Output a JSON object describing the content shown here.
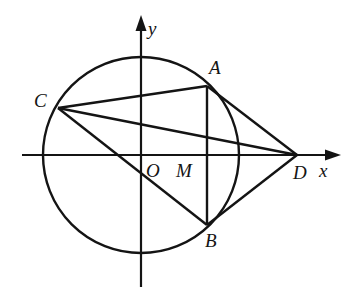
{
  "figure": {
    "kind": "geometry-diagram",
    "stroke_color": "#141414",
    "background_color": "#ffffff",
    "width": 351,
    "height": 295
  },
  "axes": {
    "x_axis": {
      "label": "x",
      "y": 155,
      "x_start": 22,
      "x_end": 335,
      "arrow": "right"
    },
    "y_axis": {
      "label": "y",
      "x": 141,
      "y_start": 18,
      "y_end": 287,
      "arrow": "up"
    },
    "origin_label": "O"
  },
  "circle": {
    "center_x": 141,
    "center_y": 155,
    "radius": 98
  },
  "points": [
    {
      "name": "A",
      "label": "A",
      "x": 207,
      "y": 86
    },
    {
      "name": "B",
      "label": "B",
      "x": 207,
      "y": 225
    },
    {
      "name": "C",
      "label": "C",
      "x": 58,
      "y": 108
    },
    {
      "name": "D",
      "label": "D",
      "x": 297,
      "y": 155
    },
    {
      "name": "M",
      "label": "M",
      "x": 207,
      "y": 155
    },
    {
      "name": "O",
      "label": "O",
      "x": 141,
      "y": 155
    }
  ],
  "segments": [
    {
      "name": "CA",
      "from": "C",
      "to": "A"
    },
    {
      "name": "CD",
      "from": "C",
      "to": "D"
    },
    {
      "name": "CB",
      "from": "C",
      "to": "B"
    },
    {
      "name": "AB",
      "from": "A",
      "to": "B"
    },
    {
      "name": "AD",
      "from": "A",
      "to": "D"
    },
    {
      "name": "BD",
      "from": "B",
      "to": "D"
    }
  ]
}
